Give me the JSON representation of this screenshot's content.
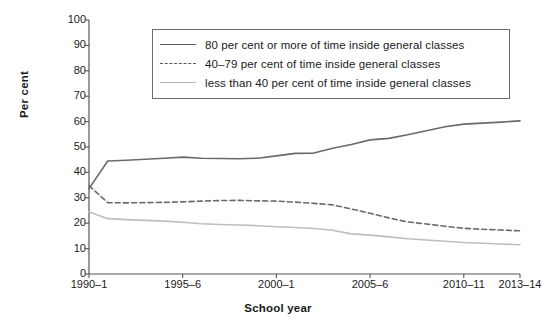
{
  "chart_data": {
    "type": "line",
    "title": "",
    "subtitle": "",
    "xlabel": "School year",
    "ylabel": "Per cent",
    "ylim": [
      0,
      100
    ],
    "ytick_labels": [
      "100",
      "90",
      "80",
      "70",
      "60",
      "50",
      "40",
      "30",
      "20",
      "10",
      "0"
    ],
    "ytick_values": [
      100,
      90,
      80,
      70,
      60,
      50,
      40,
      30,
      20,
      10,
      0
    ],
    "grid": false,
    "legend_position": "upper-center",
    "x": [
      "1990–1",
      "1991–2",
      "1992–3",
      "1993–4",
      "1994–5",
      "1995–6",
      "1996–7",
      "1997–8",
      "1998–9",
      "1999–2000",
      "2000–1",
      "2001–2",
      "2002–3",
      "2003–4",
      "2004–5",
      "2005–6",
      "2006–7",
      "2007–8",
      "2008–9",
      "2009–10",
      "2010–11",
      "2011–12",
      "2012–13",
      "2013–14"
    ],
    "xtick_labels": [
      "1990–1",
      "1995–6",
      "2000–1",
      "2005–6",
      "2010–11",
      "2013–14"
    ],
    "xtick_indices": [
      0,
      5,
      10,
      15,
      20,
      23
    ],
    "series": [
      {
        "name": "80 per cent or more of time inside general classes",
        "style": "solid",
        "color": "#6a6a6a",
        "values": [
          33.6,
          44.5,
          44.8,
          45.2,
          45.6,
          46.0,
          45.6,
          45.5,
          45.4,
          45.6,
          46.5,
          47.5,
          47.6,
          49.5,
          51.0,
          52.8,
          53.4,
          54.8,
          56.4,
          58.0,
          59.0,
          59.4,
          59.8,
          60.3
        ]
      },
      {
        "name": "40–79 per cent of time inside general classes",
        "style": "dashed",
        "color": "#6a6a6a",
        "values": [
          34.8,
          28.1,
          28.0,
          28.1,
          28.2,
          28.4,
          28.7,
          28.9,
          29.0,
          28.8,
          28.7,
          28.3,
          27.8,
          27.2,
          25.6,
          23.9,
          22.1,
          20.5,
          19.7,
          18.8,
          18.0,
          17.6,
          17.3,
          17.0
        ]
      },
      {
        "name": "less than 40 per cent of time inside general classes",
        "style": "solid",
        "color": "#bdbdbd",
        "values": [
          24.5,
          21.8,
          21.4,
          21.1,
          20.8,
          20.4,
          19.8,
          19.5,
          19.3,
          19.0,
          18.6,
          18.3,
          17.9,
          17.2,
          15.8,
          15.3,
          14.6,
          13.9,
          13.4,
          12.9,
          12.4,
          12.1,
          11.8,
          11.5
        ]
      }
    ]
  },
  "legend": {
    "entries": [
      {
        "label": "80 per cent or more of time inside general classes",
        "swatch": "solid-dark"
      },
      {
        "label": "40–79 per cent of time inside general classes",
        "swatch": "dashed-dark"
      },
      {
        "label": "less than 40 per cent of time inside general classes",
        "swatch": "solid-light"
      }
    ]
  },
  "axes": {
    "y_title": "Per cent",
    "x_title": "School year"
  },
  "colors": {
    "axis": "#555555",
    "series_dark": "#6a6a6a",
    "series_light": "#bdbdbd",
    "legend_border": "#6d6d6d",
    "background": "#ffffff"
  }
}
